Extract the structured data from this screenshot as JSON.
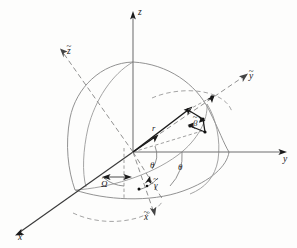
{
  "figure": {
    "background_color": "#fdfdfc",
    "line_color": "#6f6f6f",
    "vector_color": "#1b1b1b"
  },
  "axes": {
    "z": {
      "label": "z",
      "tilde": false,
      "kind": "solid-axis",
      "name": "z-axis"
    },
    "y": {
      "label": "y",
      "tilde": false,
      "kind": "solid-axis",
      "name": "y-axis"
    },
    "x": {
      "label": "x",
      "tilde": false,
      "kind": "solid-axis",
      "name": "x-axis"
    },
    "zt": {
      "label": "z",
      "tilde": true,
      "kind": "dashed-axis",
      "name": "z-tilde-axis"
    },
    "yt": {
      "label": "y",
      "tilde": true,
      "kind": "dashed-axis",
      "name": "y-tilde-axis"
    },
    "xt": {
      "label": "x",
      "tilde": true,
      "kind": "dashed-axis",
      "name": "x-tilde-axis"
    }
  },
  "vectors": {
    "r": {
      "label": "r",
      "tilde": false,
      "name": "position-vector-r"
    }
  },
  "angles": [
    {
      "id": "omega",
      "label": "Ω",
      "tilde": true,
      "name": "angle-omega-tilde"
    },
    {
      "id": "theta1",
      "label": "θ",
      "tilde": false,
      "name": "angle-theta-inner"
    },
    {
      "id": "theta2",
      "label": "θ",
      "tilde": false,
      "name": "angle-theta-outer"
    },
    {
      "id": "gamma",
      "label": "γ",
      "tilde": true,
      "name": "angle-gamma-tilde"
    },
    {
      "id": "beta",
      "label": "β",
      "tilde": true,
      "name": "angle-beta-tilde"
    }
  ],
  "glyphs": {
    "tilde": "~"
  }
}
